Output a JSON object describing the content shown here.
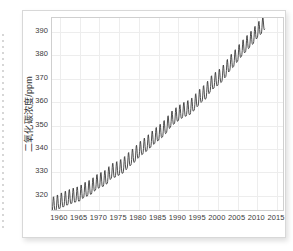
{
  "figure": {
    "y_axis_title": "二氧化碳浓度/ppm",
    "accent_color": "#3b3b3b",
    "grid_color": "#ededed",
    "frame_color": "#cfcfcf"
  },
  "chart_data": {
    "type": "line",
    "title": "",
    "xlabel": "",
    "ylabel": "二氧化碳浓度/ppm",
    "xlim": [
      1958,
      2017
    ],
    "ylim": [
      313,
      396
    ],
    "yticks": [
      320,
      330,
      340,
      350,
      360,
      370,
      380,
      390
    ],
    "xticks": [
      1960,
      1965,
      1970,
      1975,
      1980,
      1985,
      1990,
      1995,
      2000,
      2005,
      2010,
      2015
    ],
    "grid": true,
    "legend": "none",
    "seasonal_amplitude_ppm": 3.2,
    "annual_trend": {
      "x": [
        1958,
        1959,
        1960,
        1961,
        1962,
        1963,
        1964,
        1965,
        1966,
        1967,
        1968,
        1969,
        1970,
        1971,
        1972,
        1973,
        1974,
        1975,
        1976,
        1977,
        1978,
        1979,
        1980,
        1981,
        1982,
        1983,
        1984,
        1985,
        1986,
        1987,
        1988,
        1989,
        1990,
        1991,
        1992,
        1993,
        1994,
        1995,
        1996,
        1997,
        1998,
        1999,
        2000,
        2001,
        2002,
        2003,
        2004,
        2005,
        2006,
        2007,
        2008,
        2009,
        2010,
        2011,
        2012
      ],
      "values": [
        315.3,
        315.9,
        316.9,
        317.6,
        318.4,
        319.0,
        319.6,
        320.0,
        321.4,
        322.2,
        323.0,
        324.6,
        325.7,
        326.3,
        327.5,
        329.7,
        330.2,
        331.1,
        332.0,
        333.8,
        335.4,
        336.8,
        338.7,
        340.1,
        341.4,
        343.0,
        344.6,
        346.0,
        347.4,
        349.2,
        351.6,
        353.1,
        354.4,
        355.6,
        356.4,
        357.1,
        358.8,
        360.8,
        362.6,
        363.8,
        366.6,
        368.3,
        369.5,
        371.0,
        373.2,
        375.8,
        377.5,
        379.8,
        381.9,
        383.8,
        385.6,
        387.4,
        389.9,
        391.6,
        393.8
      ]
    }
  }
}
